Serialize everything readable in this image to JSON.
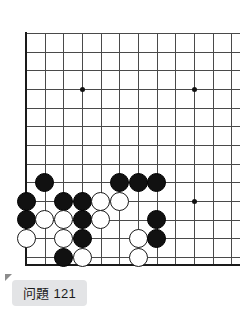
{
  "page": {
    "kind": "go-problem-diagram",
    "background_color": "#ffffff"
  },
  "caption": {
    "text": "问題 121",
    "chip_color": "#e3e4e6",
    "text_color": "#1b1b1b"
  },
  "board": {
    "line_color": "#4a4a4a",
    "edge_color": "#1a1a1a",
    "black_color": "#111111",
    "white_color": "#ffffff",
    "origin_x": 26,
    "origin_y": 33,
    "spacing": 18.67,
    "cols": 13,
    "rows": 13,
    "left_edge": true,
    "bottom_edge": true,
    "star_points": [
      {
        "col": 3,
        "row": 3
      },
      {
        "col": 9,
        "row": 3
      },
      {
        "col": 9,
        "row": 9
      }
    ],
    "stones": [
      {
        "col": 1,
        "row": 8,
        "color": "black"
      },
      {
        "col": 5,
        "row": 8,
        "color": "black"
      },
      {
        "col": 6,
        "row": 8,
        "color": "black"
      },
      {
        "col": 7,
        "row": 8,
        "color": "black"
      },
      {
        "col": 0,
        "row": 9,
        "color": "black"
      },
      {
        "col": 2,
        "row": 9,
        "color": "black"
      },
      {
        "col": 3,
        "row": 9,
        "color": "black"
      },
      {
        "col": 4,
        "row": 9,
        "color": "white"
      },
      {
        "col": 5,
        "row": 9,
        "color": "white"
      },
      {
        "col": 0,
        "row": 10,
        "color": "black"
      },
      {
        "col": 1,
        "row": 10,
        "color": "white"
      },
      {
        "col": 2,
        "row": 10,
        "color": "white"
      },
      {
        "col": 3,
        "row": 10,
        "color": "black"
      },
      {
        "col": 4,
        "row": 10,
        "color": "white"
      },
      {
        "col": 7,
        "row": 10,
        "color": "black"
      },
      {
        "col": 0,
        "row": 11,
        "color": "white"
      },
      {
        "col": 2,
        "row": 11,
        "color": "white"
      },
      {
        "col": 3,
        "row": 11,
        "color": "black"
      },
      {
        "col": 6,
        "row": 11,
        "color": "white"
      },
      {
        "col": 7,
        "row": 11,
        "color": "black"
      },
      {
        "col": 2,
        "row": 12,
        "color": "black"
      },
      {
        "col": 3,
        "row": 12,
        "color": "white"
      },
      {
        "col": 6,
        "row": 12,
        "color": "white"
      }
    ]
  }
}
